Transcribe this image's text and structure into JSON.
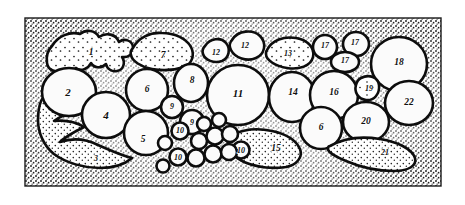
{
  "figure": {
    "frame": {
      "border_color": "#1a1a1a",
      "background_color": "#ffffff",
      "stipple_color": "#1d1d1d"
    },
    "colors": {
      "ink": "#141414",
      "paper": "#ffffff",
      "lobule_fill": "#fbfbfb",
      "matrix_stipple": "#222222",
      "outline": "#0d0d0d"
    },
    "label_count": 28,
    "unique_label_values": [
      "1",
      "2",
      "3",
      "4",
      "5",
      "6",
      "7",
      "8",
      "9",
      "10",
      "11",
      "12",
      "13",
      "14",
      "15",
      "16",
      "17",
      "18",
      "19",
      "20",
      "21",
      "22"
    ]
  },
  "labels": [
    {
      "id": "label-1",
      "text": "1",
      "x": 91,
      "y": 52,
      "size": "md",
      "region": "upper-left stippled lobe"
    },
    {
      "id": "label-2",
      "text": "2",
      "x": 68,
      "y": 92,
      "size": "lg",
      "region": "left large clear lobule"
    },
    {
      "id": "label-3",
      "text": "3",
      "x": 96,
      "y": 158,
      "size": "sm",
      "region": "lower-left stippled process"
    },
    {
      "id": "label-4",
      "text": "4",
      "x": 106,
      "y": 115,
      "size": "lg",
      "region": "left-lower clear lobule"
    },
    {
      "id": "label-5",
      "text": "5",
      "x": 143,
      "y": 139,
      "size": "md",
      "region": "left-central clear lobule"
    },
    {
      "id": "label-6a",
      "text": "6",
      "x": 147,
      "y": 89,
      "size": "md",
      "region": "central-left clear lobule"
    },
    {
      "id": "label-7",
      "text": "7",
      "x": 163,
      "y": 55,
      "size": "md",
      "region": "upper stippled lobe"
    },
    {
      "id": "label-8",
      "text": "8",
      "x": 192,
      "y": 80,
      "size": "md",
      "region": "central clear lobule"
    },
    {
      "id": "label-9a",
      "text": "9",
      "x": 172,
      "y": 106,
      "size": "sm",
      "region": "small clear follicle upper"
    },
    {
      "id": "label-9b",
      "text": "9",
      "x": 192,
      "y": 122,
      "size": "sm",
      "region": "small clear follicle lower"
    },
    {
      "id": "label-10a",
      "text": "10",
      "x": 180,
      "y": 130,
      "size": "sm",
      "region": "follicle cluster upper"
    },
    {
      "id": "label-10b",
      "text": "10",
      "x": 178,
      "y": 157,
      "size": "sm",
      "region": "follicle cluster lower-left"
    },
    {
      "id": "label-10c",
      "text": "10",
      "x": 241,
      "y": 150,
      "size": "sm",
      "region": "follicle cluster right"
    },
    {
      "id": "label-11",
      "text": "11",
      "x": 238,
      "y": 93,
      "size": "lg",
      "region": "large central clear lobule"
    },
    {
      "id": "label-12a",
      "text": "12",
      "x": 216,
      "y": 52,
      "size": "sm",
      "region": "upper small lobe left"
    },
    {
      "id": "label-12b",
      "text": "12",
      "x": 245,
      "y": 45,
      "size": "sm",
      "region": "upper small lobe right"
    },
    {
      "id": "label-13",
      "text": "13",
      "x": 288,
      "y": 53,
      "size": "sm",
      "region": "upper stippled lobe right"
    },
    {
      "id": "label-14",
      "text": "14",
      "x": 293,
      "y": 92,
      "size": "md",
      "region": "right-central clear lobule"
    },
    {
      "id": "label-15",
      "text": "15",
      "x": 276,
      "y": 148,
      "size": "md",
      "region": "lower stippled band"
    },
    {
      "id": "label-16",
      "text": "16",
      "x": 334,
      "y": 92,
      "size": "md",
      "region": "right clear lobule"
    },
    {
      "id": "label-17a",
      "text": "17",
      "x": 325,
      "y": 45,
      "size": "sm",
      "region": "upper small lobe"
    },
    {
      "id": "label-17b",
      "text": "17",
      "x": 355,
      "y": 42,
      "size": "sm",
      "region": "upper small lobe"
    },
    {
      "id": "label-17c",
      "text": "17",
      "x": 345,
      "y": 60,
      "size": "sm",
      "region": "upper small lobe middle"
    },
    {
      "id": "label-18",
      "text": "18",
      "x": 399,
      "y": 62,
      "size": "md",
      "region": "upper-right large clear lobule"
    },
    {
      "id": "label-19",
      "text": "19",
      "x": 369,
      "y": 88,
      "size": "sm",
      "region": "narrow wedge lobule"
    },
    {
      "id": "label-20",
      "text": "20",
      "x": 366,
      "y": 121,
      "size": "md",
      "region": "lower-right clear lobule"
    },
    {
      "id": "label-21",
      "text": "21",
      "x": 385,
      "y": 152,
      "size": "sm",
      "region": "lower-right stippled band"
    },
    {
      "id": "label-22",
      "text": "22",
      "x": 409,
      "y": 102,
      "size": "md",
      "region": "far-right clear lobule"
    },
    {
      "id": "label-6b",
      "text": "6",
      "x": 321,
      "y": 127,
      "size": "md",
      "region": "lower-right clear lobule"
    }
  ]
}
